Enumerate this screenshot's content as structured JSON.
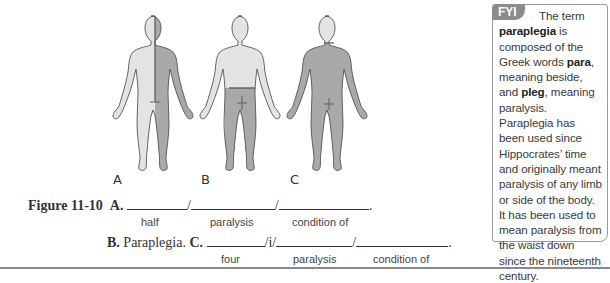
{
  "figure": {
    "labels": [
      "A",
      "B",
      "C"
    ],
    "colors": {
      "light": "#e3e3e3",
      "dark": "#a9a9a9",
      "outline": "#555555"
    }
  },
  "fyi": {
    "tab": "FYI",
    "lead": "The term",
    "term": "paraplegia",
    "t1": " is composed of the Greek words ",
    "para": "para",
    "t2": ", meaning beside, and ",
    "pleg": "pleg",
    "t3": ", meaning paralysis. Paraplegia has been used since Hippocrates’ time and originally meant paralysis of any limb or side of the body. It has been used to mean paralysis from the waist down since the nineteenth century."
  },
  "caption": {
    "figure_label": "Figure 11-10",
    "a_label": "A.",
    "a_hints": [
      "half",
      "paralysis",
      "condition of"
    ],
    "b_label": "B.",
    "b_text": "Paraplegia.",
    "c_label": "C.",
    "c_connector": "/i/",
    "c_hints": [
      "four",
      "paralysis",
      "condition of"
    ]
  }
}
